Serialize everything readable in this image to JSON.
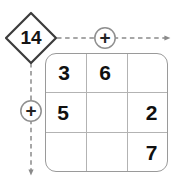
{
  "puzzle": {
    "type": "kenken-cage-diagram",
    "canvas": {
      "width": 179,
      "height": 184,
      "background": "#ffffff"
    },
    "clue": {
      "label": "14",
      "shape": "diamond",
      "stroke_color": "#3b3b3b",
      "text_color": "#151515"
    },
    "operators": [
      {
        "name": "horizontal-plus",
        "symbol": "+",
        "direction": "right",
        "line_style": "dashed",
        "color": "#8a8a8a"
      },
      {
        "name": "vertical-plus",
        "symbol": "+",
        "direction": "down",
        "line_style": "dashed",
        "color": "#8a8a8a"
      }
    ],
    "grid": {
      "rows": 3,
      "columns": 3,
      "border_color": "#9a9a9a",
      "line_color": "#b3b3b3",
      "cell_background": "#ffffff",
      "cells": [
        [
          {
            "name": "cell-r1c1",
            "value": "3"
          },
          {
            "name": "cell-r1c2",
            "value": "6"
          },
          {
            "name": "cell-r1c3",
            "value": ""
          }
        ],
        [
          {
            "name": "cell-r2c1",
            "value": "5"
          },
          {
            "name": "cell-r2c2",
            "value": ""
          },
          {
            "name": "cell-r2c3",
            "value": "2"
          }
        ],
        [
          {
            "name": "cell-r3c1",
            "value": ""
          },
          {
            "name": "cell-r3c2",
            "value": ""
          },
          {
            "name": "cell-r3c3",
            "value": "7"
          }
        ]
      ]
    }
  }
}
